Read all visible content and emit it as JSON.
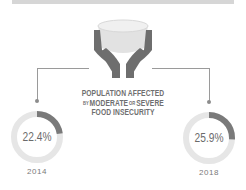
{
  "header_bar": {
    "color": "#d6d6d6"
  },
  "icon": {
    "name": "hands-holding-bowl-icon",
    "color": "#6e6e6e",
    "bowl_color": "#e4e4e4"
  },
  "title": {
    "line1": "POPULATION AFFECTED",
    "line2_a": "BY",
    "line2_b": "MODERATE",
    "line2_c": "OR",
    "line2_d": "SEVERE",
    "line3": "FOOD INSECURITY"
  },
  "stats": [
    {
      "value": "22.4%",
      "percent": 22.4,
      "year": "2014"
    },
    {
      "value": "25.9%",
      "percent": 25.9,
      "year": "2018"
    }
  ],
  "colors": {
    "accent": "#7a7a7a",
    "track": "#e6e6e6",
    "text": "#6b6b6b"
  }
}
